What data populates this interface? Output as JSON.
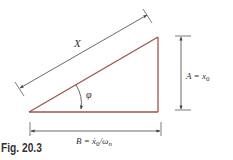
{
  "figure": {
    "caption": "Fig. 20.3",
    "labels": {
      "hypotenuse": "X",
      "angle": "φ",
      "vertical_label_A": "A = x",
      "vertical_sub": "0",
      "horizontal_label_B": "B = ẋ",
      "horizontal_sub0": "0",
      "horizontal_slash": "/ω",
      "horizontal_sub_n": "n"
    },
    "colors": {
      "triangle_stroke": "#a0524a",
      "dimension_stroke": "#444444"
    }
  }
}
